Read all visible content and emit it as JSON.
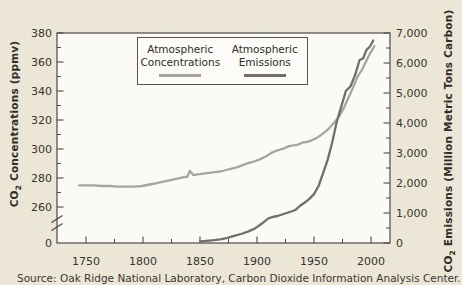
{
  "figure": {
    "background_color": "#ece6d6",
    "plot_background_color": "#fbfaf5",
    "axis_color": "#4b4a45",
    "text_color": "#35342f"
  },
  "axes": {
    "left": {
      "label_prefix": "CO",
      "label_sub": "2",
      "label_rest": " Concentrations (ppmv)"
    },
    "right": {
      "label_prefix": "CO",
      "label_sub": "2",
      "label_rest": " Emissions (Million Metric Tons Carbon)"
    }
  },
  "legend": {
    "items": [
      {
        "line1": "Atmospheric",
        "line2": "Concentrations",
        "color": "#a6a5a0"
      },
      {
        "line1": "Atmospheric",
        "line2": "Emissions",
        "color": "#716f6b"
      }
    ]
  },
  "source": {
    "text": "Source: Oak Ridge National Laboratory, Carbon Dioxide Information Analysis Center."
  },
  "chart_data": {
    "type": "line",
    "title": "",
    "x_axis_label": "",
    "x_range_drawn": [
      1724,
      2017
    ],
    "x_ticks": [
      {
        "v": 1750,
        "label": "1750"
      },
      {
        "v": 1800,
        "label": "1800"
      },
      {
        "v": 1850,
        "label": "1850"
      },
      {
        "v": 1900,
        "label": "1900"
      },
      {
        "v": 1950,
        "label": "1950"
      },
      {
        "v": 2000,
        "label": "2000"
      }
    ],
    "x_minor_ticks": [
      1775,
      1825,
      1875,
      1925,
      1975
    ],
    "y_left": {
      "label": "CO2 Concentrations (ppmv)",
      "range": [
        260,
        380
      ],
      "axis_break_to_zero": true,
      "zero": {
        "v": 0,
        "label": "0"
      },
      "ticks": [
        {
          "v": 380,
          "label": "380"
        },
        {
          "v": 360,
          "label": "360"
        },
        {
          "v": 340,
          "label": "340"
        },
        {
          "v": 320,
          "label": "320"
        },
        {
          "v": 300,
          "label": "300"
        },
        {
          "v": 280,
          "label": "280"
        },
        {
          "v": 260,
          "label": "260"
        }
      ],
      "minor_ticks": [
        370,
        350,
        330,
        310,
        290,
        270
      ]
    },
    "y_right": {
      "label": "CO2 Emissions (Million Metric Tons Carbon)",
      "range": [
        0,
        7000
      ],
      "minor_step": 500,
      "ticks": [
        {
          "v": 7000,
          "label": "7,000"
        },
        {
          "v": 6000,
          "label": "6,000"
        },
        {
          "v": 5000,
          "label": "5,000"
        },
        {
          "v": 4000,
          "label": "4,000"
        },
        {
          "v": 3000,
          "label": "3,000"
        },
        {
          "v": 2000,
          "label": "2,000"
        },
        {
          "v": 1000,
          "label": "1,000"
        },
        {
          "v": 0,
          "label": "0"
        }
      ]
    },
    "series": [
      {
        "name": "Atmospheric Concentrations",
        "axis": "left",
        "unit": "ppmv",
        "color": "#a6a5a0",
        "points": [
          [
            1744,
            275
          ],
          [
            1750,
            275
          ],
          [
            1757,
            275
          ],
          [
            1764,
            274.5
          ],
          [
            1771,
            274.5
          ],
          [
            1778,
            274
          ],
          [
            1785,
            274
          ],
          [
            1792,
            274
          ],
          [
            1799,
            274.5
          ],
          [
            1806,
            275.5
          ],
          [
            1812,
            276.5
          ],
          [
            1818,
            277.5
          ],
          [
            1824,
            278.5
          ],
          [
            1830,
            279.5
          ],
          [
            1835,
            280.5
          ],
          [
            1839,
            281
          ],
          [
            1841,
            285
          ],
          [
            1844,
            282
          ],
          [
            1848,
            282.5
          ],
          [
            1853,
            283
          ],
          [
            1858,
            283.5
          ],
          [
            1863,
            284
          ],
          [
            1868,
            284.5
          ],
          [
            1873,
            285.5
          ],
          [
            1878,
            286.5
          ],
          [
            1883,
            287.5
          ],
          [
            1888,
            289
          ],
          [
            1893,
            290.5
          ],
          [
            1898,
            291.5
          ],
          [
            1903,
            293
          ],
          [
            1908,
            295
          ],
          [
            1913,
            297.5
          ],
          [
            1916,
            298.5
          ],
          [
            1920,
            299.5
          ],
          [
            1924,
            300.5
          ],
          [
            1928,
            302
          ],
          [
            1932,
            302.5
          ],
          [
            1936,
            303
          ],
          [
            1940,
            304.5
          ],
          [
            1944,
            305
          ],
          [
            1948,
            306
          ],
          [
            1952,
            307.5
          ],
          [
            1956,
            309.5
          ],
          [
            1960,
            312
          ],
          [
            1964,
            315
          ],
          [
            1968,
            318.5
          ],
          [
            1972,
            322.5
          ],
          [
            1976,
            328
          ],
          [
            1980,
            335
          ],
          [
            1984,
            342
          ],
          [
            1988,
            349.5
          ],
          [
            1992,
            354.5
          ],
          [
            1996,
            361
          ],
          [
            2000,
            367
          ],
          [
            2003,
            371
          ]
        ]
      },
      {
        "name": "Atmospheric Emissions",
        "axis": "right",
        "unit": "Million Metric Tons Carbon",
        "color": "#716f6b",
        "points": [
          [
            1850,
            50
          ],
          [
            1856,
            70
          ],
          [
            1862,
            95
          ],
          [
            1868,
            125
          ],
          [
            1874,
            170
          ],
          [
            1880,
            240
          ],
          [
            1886,
            300
          ],
          [
            1892,
            380
          ],
          [
            1898,
            480
          ],
          [
            1904,
            640
          ],
          [
            1910,
            820
          ],
          [
            1914,
            870
          ],
          [
            1918,
            900
          ],
          [
            1922,
            950
          ],
          [
            1926,
            1000
          ],
          [
            1930,
            1050
          ],
          [
            1934,
            1110
          ],
          [
            1938,
            1250
          ],
          [
            1942,
            1350
          ],
          [
            1946,
            1470
          ],
          [
            1950,
            1630
          ],
          [
            1954,
            1900
          ],
          [
            1958,
            2330
          ],
          [
            1962,
            2780
          ],
          [
            1966,
            3350
          ],
          [
            1970,
            4050
          ],
          [
            1974,
            4560
          ],
          [
            1978,
            5070
          ],
          [
            1982,
            5220
          ],
          [
            1986,
            5590
          ],
          [
            1990,
            6100
          ],
          [
            1993,
            6150
          ],
          [
            1996,
            6430
          ],
          [
            1999,
            6550
          ],
          [
            2002,
            6750
          ]
        ]
      }
    ]
  }
}
